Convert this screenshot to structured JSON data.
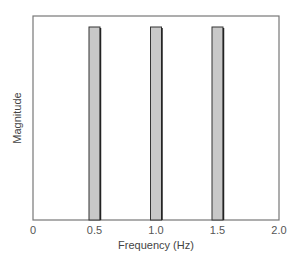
{
  "chart_data": {
    "type": "bar",
    "title": "",
    "xlabel": "Frequency (Hz)",
    "ylabel": "Magnitude",
    "x": [
      0.5,
      1.0,
      1.5
    ],
    "categories": [
      "0.5",
      "1.0",
      "1.5"
    ],
    "values": [
      1,
      1,
      1
    ],
    "xlim": [
      0,
      2.0
    ],
    "xticks": [
      "0",
      "0.5",
      "1.0",
      "1.5",
      "2.0"
    ],
    "yticks": [],
    "grid": false,
    "legend": null,
    "colors": {
      "bar_fill": "#c8c8c8",
      "bar_edge": "#333333",
      "frame": "#777777"
    }
  }
}
